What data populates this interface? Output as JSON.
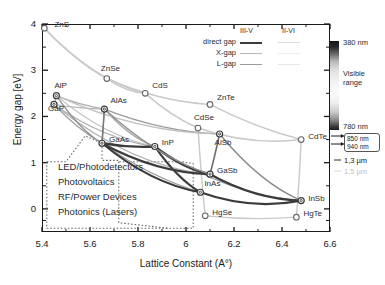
{
  "chart_data": {
    "type": "scatter",
    "title": "",
    "xlabel": "Lattice Constant (A°)",
    "ylabel": "Energy gap [eV]",
    "xlim": [
      5.4,
      6.6
    ],
    "ylim": [
      -0.5,
      4.0
    ],
    "xticks": [
      "5.4",
      "5.6",
      "5.8",
      "6",
      "6.2",
      "6.4",
      "6.6"
    ],
    "xtick_values": [
      5.4,
      5.6,
      5.8,
      6.0,
      6.2,
      6.4,
      6.6
    ],
    "yticks": [
      "0",
      "1",
      "2",
      "3",
      "4"
    ],
    "ytick_values": [
      0,
      1,
      2,
      3,
      4
    ],
    "grid": false,
    "points": [
      {
        "label": "ZnS",
        "x": 5.41,
        "y": 3.91,
        "family": "II-VI",
        "lx": 10,
        "ly": -4
      },
      {
        "label": "ZnSe",
        "x": 5.67,
        "y": 2.82,
        "family": "II-VI",
        "lx": -6,
        "ly": -11
      },
      {
        "label": "CdS",
        "x": 5.83,
        "y": 2.5,
        "family": "II-VI",
        "lx": 7,
        "ly": -8
      },
      {
        "label": "ZnTe",
        "x": 6.1,
        "y": 2.26,
        "family": "II-VI",
        "lx": 7,
        "ly": -7
      },
      {
        "label": "CdSe",
        "x": 6.05,
        "y": 1.75,
        "family": "II-VI",
        "lx": -4,
        "ly": -11
      },
      {
        "label": "CdTe",
        "x": 6.48,
        "y": 1.5,
        "family": "II-VI",
        "lx": 7,
        "ly": -4
      },
      {
        "label": "HgSe",
        "x": 6.08,
        "y": -0.15,
        "family": "II-VI",
        "lx": 7,
        "ly": -4
      },
      {
        "label": "HgTe",
        "x": 6.46,
        "y": -0.18,
        "family": "II-VI",
        "lx": 7,
        "ly": -4
      },
      {
        "label": "AlP",
        "x": 5.46,
        "y": 2.45,
        "family": "III-V",
        "lx": -2,
        "ly": -11
      },
      {
        "label": "GaP",
        "x": 5.45,
        "y": 2.26,
        "family": "III-V",
        "lx": -6,
        "ly": 4
      },
      {
        "label": "AlAs",
        "x": 5.66,
        "y": 2.16,
        "family": "III-V",
        "lx": 6,
        "ly": -9
      },
      {
        "label": "GaAs",
        "x": 5.65,
        "y": 1.42,
        "family": "III-V",
        "lx": 7,
        "ly": -4
      },
      {
        "label": "InP",
        "x": 5.87,
        "y": 1.35,
        "family": "III-V",
        "lx": 7,
        "ly": -4
      },
      {
        "label": "AlSb",
        "x": 6.14,
        "y": 1.62,
        "family": "III-V",
        "lx": -5,
        "ly": 8
      },
      {
        "label": "GaSb",
        "x": 6.1,
        "y": 0.75,
        "family": "III-V",
        "lx": 7,
        "ly": -4
      },
      {
        "label": "InAs",
        "x": 6.06,
        "y": 0.36,
        "family": "III-V",
        "lx": 4,
        "ly": -9
      },
      {
        "label": "InSb",
        "x": 6.48,
        "y": 0.18,
        "family": "III-V",
        "lx": 7,
        "ly": -3
      }
    ]
  },
  "legend": {
    "col_headers": [
      "III-V",
      "II-VI"
    ],
    "rows": [
      "direct gap",
      "X-gap",
      "L-gap"
    ]
  },
  "applications": {
    "items": [
      "LED/Photodetectors",
      "Photovoltaics",
      "RF/Power Devices",
      "Photonics (Lasers)"
    ]
  },
  "colorbar": {
    "top_label": "380 nm",
    "mid_label_1": "Visible",
    "mid_label_2": "range",
    "bottom_label": "780 nm",
    "marker_1": "850 nm",
    "marker_2": "940 nm",
    "tele_1": "1,3 µm",
    "tele_2": "1,5 µm"
  },
  "colors": {
    "iii_v": "#3b3b3b",
    "ii_vi": "#c9c9c9",
    "axis": "#1a1a1a",
    "dotted_region": "#6b6b6b"
  }
}
